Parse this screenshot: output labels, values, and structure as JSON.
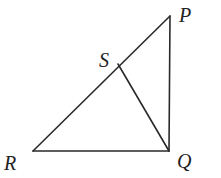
{
  "diagram": {
    "type": "geometry-triangle",
    "colors": {
      "stroke": "#2a2a2a",
      "label": "#222222",
      "background": "#ffffff"
    },
    "points": {
      "P": {
        "label": "P",
        "x": 170,
        "y": 16,
        "lx": 179,
        "ly": 22
      },
      "Q": {
        "label": "Q",
        "x": 169,
        "y": 151,
        "lx": 177,
        "ly": 168
      },
      "R": {
        "label": "R",
        "x": 33,
        "y": 151,
        "lx": 4,
        "ly": 170
      },
      "S": {
        "label": "S",
        "x": 118,
        "y": 64,
        "lx": 99,
        "ly": 67
      }
    },
    "segments": [
      {
        "name": "segment-RP",
        "from": "R",
        "to": "P"
      },
      {
        "name": "segment-PQ",
        "from": "P",
        "to": "Q"
      },
      {
        "name": "segment-RQ",
        "from": "R",
        "to": "Q"
      },
      {
        "name": "segment-SQ",
        "from": "S",
        "to": "Q"
      }
    ]
  }
}
